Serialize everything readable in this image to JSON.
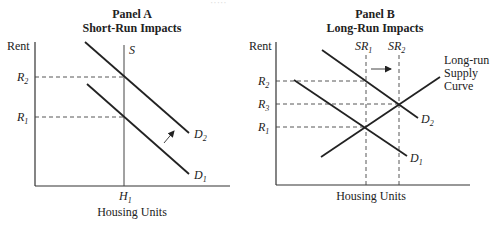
{
  "header": {
    "cutoff_text": "·····"
  },
  "panel_a": {
    "title_line1": "Panel A",
    "title_line2": "Short-Run Impacts",
    "y_axis_label": "Rent",
    "x_axis_label": "Housing Units",
    "supply_label": "S",
    "r2": {
      "main": "R",
      "sub": "2"
    },
    "r1": {
      "main": "R",
      "sub": "1"
    },
    "h1": {
      "main": "H",
      "sub": "1"
    },
    "d2": {
      "main": "D",
      "sub": "2"
    },
    "d1": {
      "main": "D",
      "sub": "1"
    }
  },
  "panel_b": {
    "title_line1": "Panel B",
    "title_line2": "Long-Run Impacts",
    "y_axis_label": "Rent",
    "x_axis_label": "Housing Units",
    "sr1": {
      "main": "SR",
      "sub": "1"
    },
    "sr2": {
      "main": "SR",
      "sub": "2"
    },
    "r2": {
      "main": "R",
      "sub": "2"
    },
    "r3": {
      "main": "R",
      "sub": "3"
    },
    "r1": {
      "main": "R",
      "sub": "1"
    },
    "d2": {
      "main": "D",
      "sub": "2"
    },
    "d1": {
      "main": "D",
      "sub": "1"
    },
    "lrs_line1": "Long-run",
    "lrs_line2": "Supply",
    "lrs_line3": "Curve"
  },
  "colors": {
    "line": "#222222",
    "background": "#ffffff"
  }
}
